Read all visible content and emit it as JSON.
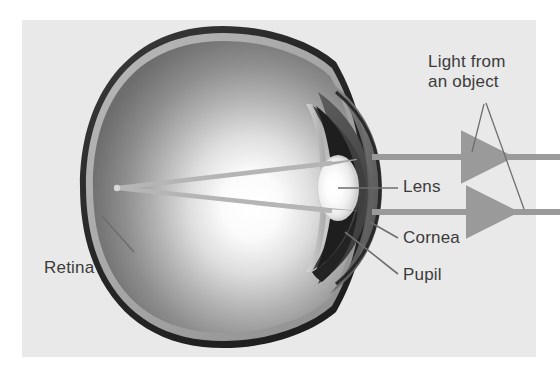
{
  "figure": {
    "background_color": "#ffffff",
    "panel_color": "#e9e9e9",
    "text_color": "#3b3b3b",
    "ray_color": "#9a9a9a",
    "leader_color": "#6e6e6e"
  },
  "labels": {
    "light_line1": "Light from",
    "light_line2": "an object",
    "lens": "Lens",
    "cornea": "Cornea",
    "pupil": "Pupil",
    "retina": "Retina"
  },
  "parts": {
    "sclera": "sclera-outer-wall",
    "retina_layer": "retina-inner-lining",
    "vitreous": "vitreous-body",
    "iris": "iris",
    "pupil": "pupil-opening",
    "lens": "lens",
    "cornea": "cornea-dome",
    "focal_point": "retinal-focal-point"
  },
  "rays": [
    {
      "name": "upper-light-ray",
      "y": 157,
      "direction": "leftward",
      "arrow_x": 470
    },
    {
      "name": "lower-light-ray",
      "y": 212,
      "direction": "leftward",
      "arrow_x": 475
    }
  ]
}
